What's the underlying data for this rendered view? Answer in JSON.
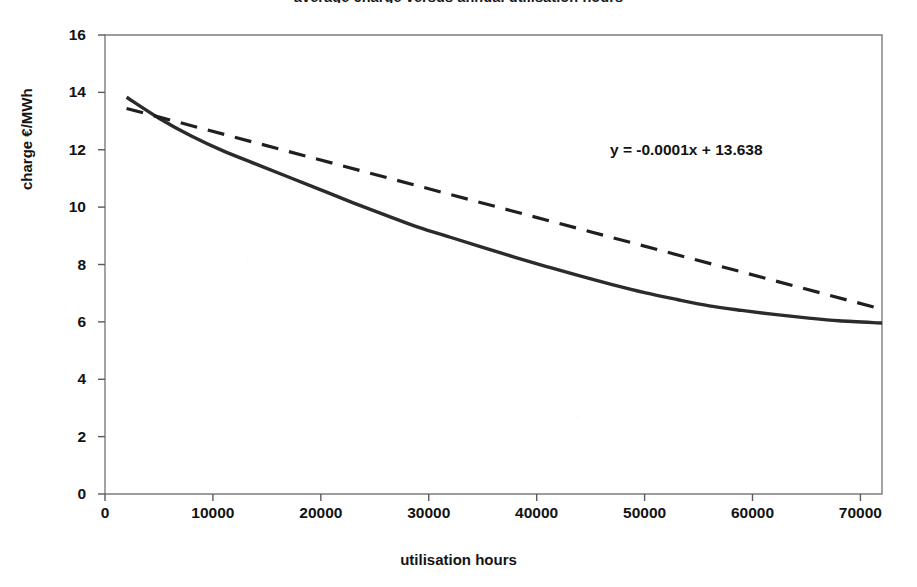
{
  "chart_data": {
    "type": "line",
    "title": "average charge versus annual utilisation hours",
    "xlabel": "utilisation hours",
    "ylabel": "charge €/MWh",
    "xlim": [
      0,
      72000
    ],
    "ylim": [
      0,
      16
    ],
    "xticks": [
      0,
      10000,
      20000,
      30000,
      40000,
      50000,
      60000,
      70000
    ],
    "xtick_labels": [
      "0",
      "10000",
      "20000",
      "30000",
      "40000",
      "50000",
      "60000",
      "70000"
    ],
    "yticks": [
      0,
      2,
      4,
      6,
      8,
      10,
      12,
      14,
      16
    ],
    "ytick_labels": [
      "0",
      "2",
      "4",
      "6",
      "8",
      "10",
      "12",
      "14",
      "16"
    ],
    "grid": false,
    "legend": "none",
    "annotations": [
      {
        "text": "y = -0.0001x + 13.638",
        "x": 47000,
        "y": 12.3
      }
    ],
    "series": [
      {
        "name": "average charge",
        "style": "solid",
        "color": "#2b2b2b",
        "width": 3.4,
        "points": [
          [
            2000,
            13.83
          ],
          [
            5000,
            13.1
          ],
          [
            8000,
            12.48
          ],
          [
            11000,
            11.95
          ],
          [
            14000,
            11.5
          ],
          [
            17000,
            11.05
          ],
          [
            20000,
            10.6
          ],
          [
            23000,
            10.15
          ],
          [
            26000,
            9.72
          ],
          [
            29000,
            9.3
          ],
          [
            32000,
            8.95
          ],
          [
            35000,
            8.6
          ],
          [
            38000,
            8.25
          ],
          [
            41000,
            7.92
          ],
          [
            44000,
            7.6
          ],
          [
            47000,
            7.3
          ],
          [
            50000,
            7.02
          ],
          [
            53000,
            6.78
          ],
          [
            56000,
            6.56
          ],
          [
            59000,
            6.4
          ],
          [
            62000,
            6.26
          ],
          [
            65000,
            6.14
          ],
          [
            68000,
            6.04
          ],
          [
            72000,
            5.96
          ]
        ]
      },
      {
        "name": "linear trend line",
        "style": "dashed",
        "color": "#1f1f1f",
        "width": 3.2,
        "equation": "y = -0.0001x + 13.638",
        "slope": -0.0001,
        "intercept": 13.638,
        "points": [
          [
            2000,
            13.44
          ],
          [
            72000,
            6.44
          ]
        ]
      }
    ],
    "intersections": [
      {
        "x": 14000,
        "y": 11.5
      },
      {
        "x": 63000,
        "y": 6.2
      }
    ]
  },
  "axis": {
    "frame_color": "#7c7c7c",
    "tick_color": "#5a5a5a"
  }
}
